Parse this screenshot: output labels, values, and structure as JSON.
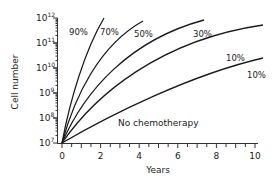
{
  "chart_data": {
    "type": "line",
    "title": "",
    "xlabel": "Years",
    "ylabel": "Cell number",
    "xlim": [
      0,
      10.5
    ],
    "ylim_log10": [
      7,
      12
    ],
    "yscale": "log",
    "grid": false,
    "x_ticks": [
      "0",
      "2",
      "4",
      "6",
      "8",
      "10"
    ],
    "y_ticks": [
      "10^7",
      "10^8",
      "10^9",
      "10^10",
      "10^11",
      "10^12"
    ],
    "series": [
      {
        "name": "curve-1",
        "x": [
          0,
          0.5,
          1.0,
          1.5,
          2.2
        ],
        "log10_y": [
          7,
          8.9,
          10.2,
          11.2,
          12.0
        ]
      },
      {
        "name": "curve-2",
        "x": [
          0,
          1,
          2,
          3,
          4.2
        ],
        "log10_y": [
          7,
          9.2,
          10.5,
          11.3,
          11.9
        ]
      },
      {
        "name": "curve-3",
        "x": [
          0,
          2,
          4,
          6,
          7.4
        ],
        "log10_y": [
          7,
          9.6,
          10.9,
          11.6,
          11.9
        ]
      },
      {
        "name": "curve-4",
        "x": [
          0,
          2,
          4,
          6,
          8,
          10.4
        ],
        "log10_y": [
          7,
          9.0,
          10.1,
          10.9,
          11.4,
          11.7
        ]
      },
      {
        "name": "curve-5",
        "x": [
          0,
          2,
          4,
          6,
          8,
          10.4
        ],
        "log10_y": [
          7,
          8.1,
          8.9,
          9.5,
          10.0,
          10.4
        ]
      }
    ],
    "annotations": [
      {
        "text": "90%",
        "x": 0.6,
        "y_log10": 11.4
      },
      {
        "text": "70%",
        "x": 2.3,
        "y_log10": 11.4
      },
      {
        "text": "50%",
        "x": 4.4,
        "y_log10": 11.3
      },
      {
        "text": "30%",
        "x": 7.2,
        "y_log10": 11.3
      },
      {
        "text": "10%",
        "x": 8.8,
        "y_log10": 10.4
      },
      {
        "text": "10%",
        "x": 9.8,
        "y_log10": 9.7
      },
      {
        "text": "No chemotherapy",
        "x": 2.7,
        "y_log10": 7.8
      }
    ]
  },
  "labels": {
    "xlabel": "Years",
    "ylabel": "Cell number",
    "x_ticks": [
      "0",
      "2",
      "4",
      "6",
      "8",
      "10"
    ],
    "y_base": "10",
    "y_exps": [
      "12",
      "11",
      "10",
      "9",
      "8",
      "7"
    ],
    "ann": [
      "90%",
      "70%",
      "50%",
      "30%",
      "10%",
      "10%",
      "No chemotherapy"
    ]
  }
}
